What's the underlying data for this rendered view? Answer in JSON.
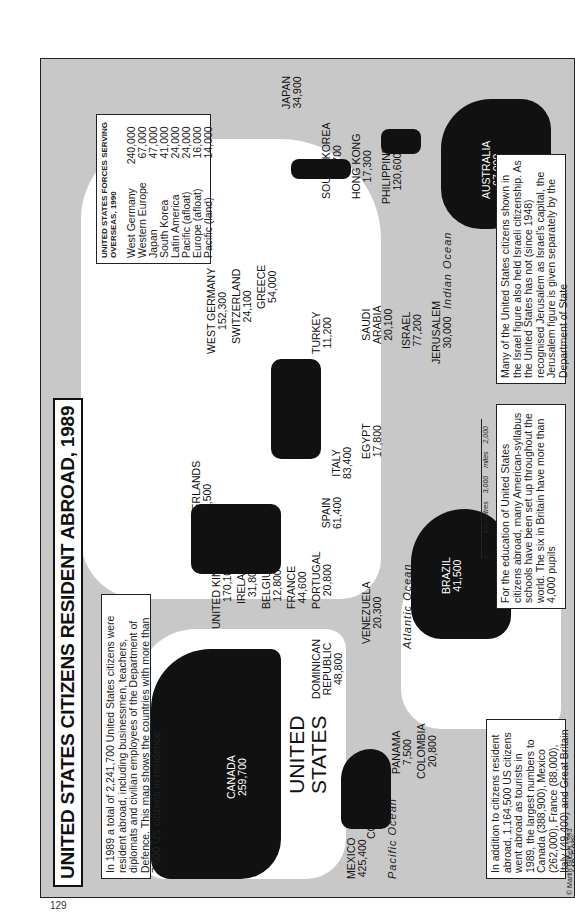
{
  "page_number": "129",
  "title": "UNITED STATES CITIZENS RESIDENT ABROAD, 1989",
  "intro_note": "In 1989 a total of 2,241,700 United States citizens were resident abroad, including businessmen, teachers, diplomats and civilian employees of the Department of Defence. This map shows the countries with more than 7,500 US citizens in residence",
  "countries": [
    {
      "name": "CANADA",
      "value": "259,700"
    },
    {
      "name": "UNITED STATES",
      "value": ""
    },
    {
      "name": "MEXICO",
      "value": "425,400"
    },
    {
      "name": "COSTA RICA",
      "value": "23,700"
    },
    {
      "name": "PANAMA",
      "value": "7,500"
    },
    {
      "name": "COLOMBIA",
      "value": "20,800"
    },
    {
      "name": "DOMINICAN REPUBLIC",
      "value": "48,800"
    },
    {
      "name": "VENEZUELA",
      "value": "20,300"
    },
    {
      "name": "BRAZIL",
      "value": "41,500"
    },
    {
      "name": "UNITED KINGDOM",
      "value": "170,100"
    },
    {
      "name": "IRELAND",
      "value": "31,800"
    },
    {
      "name": "BELGIUM",
      "value": "12,800"
    },
    {
      "name": "FRANCE",
      "value": "44,600"
    },
    {
      "name": "PORTUGAL",
      "value": "20,800"
    },
    {
      "name": "NETHERLANDS",
      "value": "22,500"
    },
    {
      "name": "SPAIN",
      "value": "61,400"
    },
    {
      "name": "ITALY",
      "value": "83,400"
    },
    {
      "name": "WEST GERMANY",
      "value": "152,300"
    },
    {
      "name": "SWITZERLAND",
      "value": "24,100"
    },
    {
      "name": "GREECE",
      "value": "54,000"
    },
    {
      "name": "TURKEY",
      "value": "11,200"
    },
    {
      "name": "EGYPT",
      "value": "17,800"
    },
    {
      "name": "SAUDI ARABIA",
      "value": "20,100"
    },
    {
      "name": "ISRAEL",
      "value": "77,200"
    },
    {
      "name": "JERUSALEM",
      "value": "30,000"
    },
    {
      "name": "JAPAN",
      "value": "34,900"
    },
    {
      "name": "SOUTH KOREA",
      "value": "11,700"
    },
    {
      "name": "HONG KONG",
      "value": "17,300"
    },
    {
      "name": "PHILIPPINES",
      "value": "120,600"
    },
    {
      "name": "AUSTRALIA",
      "value": "67,000"
    }
  ],
  "oceans": {
    "pacific": "Pacific Ocean",
    "atlantic": "Atlantic Ocean",
    "indian": "Indian Ocean"
  },
  "forces_box": {
    "heading": "UNITED STATES FORCES SERVING OVERSEAS, 1990",
    "rows": [
      {
        "label": "West Germany",
        "value": "240,000"
      },
      {
        "label": "Western Europe",
        "value": "67,000"
      },
      {
        "label": "Japan",
        "value": "47,000"
      },
      {
        "label": "South Korea",
        "value": "41,000"
      },
      {
        "label": "Latin America",
        "value": "24,000"
      },
      {
        "label": "Pacific (afloat)",
        "value": "24,000"
      },
      {
        "label": "Europe (afloat)",
        "value": "16,000"
      },
      {
        "label": "Pacific (land)",
        "value": "14,000"
      }
    ]
  },
  "tourists_note": "In addition to citizens resident abroad, 1,164,500 US citizens went abroad as tourists in 1989, the largest numbers to Canada (388,900), Mexico (262,000), France (88,000), Italy (49,400) and Great Britain (42,500)",
  "schools_note": "For the education of United States citizens abroad, many American-syllabus schools have been set up throughout the world. The six in Britain have more than 4,000 pupils",
  "israel_note": "Many of the United States citizens shown in the Israel figure also held Israeli citizenship. As the United States has not (since 1948) recognised Jerusalem as Israel's capital, the Jerusalem figure is given separately by the Department of State",
  "scale": {
    "km_label": "kilometres",
    "km_max": "3,000",
    "mi_label": "miles",
    "mi_max": "2,000",
    "zero": "0"
  },
  "copyright": "© Martin Gilbert 1993"
}
